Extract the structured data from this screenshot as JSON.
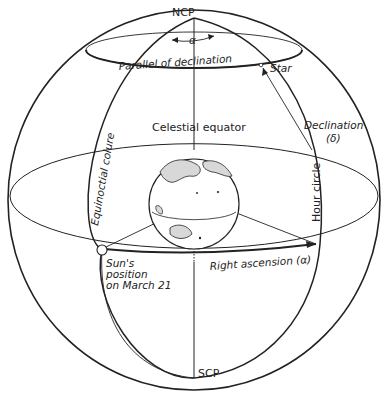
{
  "diagram": {
    "labels": {
      "ncp": "NCP",
      "scp": "SCP",
      "alpha_top": "α",
      "parallel": "Parallel of declination",
      "star": "Star",
      "celestial_equator": "Celestial equator",
      "declination": "Declination",
      "declination_symbol": "(δ)",
      "equinoctial_colure": "Equinoctial colure",
      "hour_circle": "Hour circle",
      "sun_line1": "Sun's",
      "sun_line2": "position",
      "sun_line3": "on March 21",
      "right_ascension": "Right ascension (α)"
    },
    "colors": {
      "line": "#222222",
      "background": "#ffffff",
      "land": "#d8d8d8"
    }
  }
}
